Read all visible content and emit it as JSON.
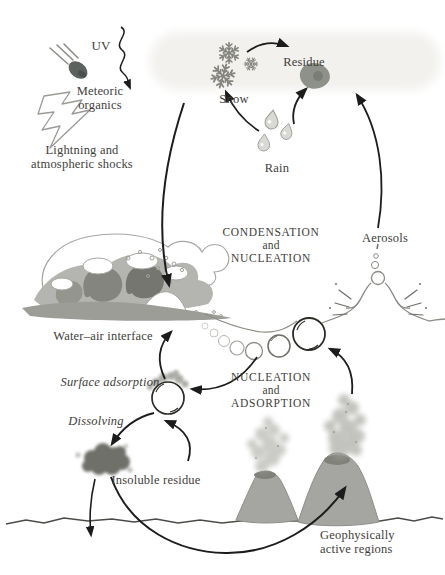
{
  "figure": {
    "type": "cycle-diagram"
  },
  "labels": {
    "uv": "UV",
    "meteoric": [
      "Meteoric",
      "organics"
    ],
    "lightning": [
      "Lightning and",
      "atmospheric shocks"
    ],
    "snow": "Snow",
    "residue": "Residue",
    "rain": "Rain",
    "condensation": [
      "CONDENSATION",
      "and",
      "NUCLEATION"
    ],
    "aerosols": "Aerosols",
    "water_air": "Water–air interface",
    "surface_adsorption": "Surface adsorption",
    "dissolving": "Dissolving",
    "insoluble_residue": "Insoluble residue",
    "nucleation": [
      "NUCLEATION",
      "and",
      "ADSORPTION"
    ],
    "geo": [
      "Geophysically",
      "active regions"
    ]
  },
  "icons": [
    "meteor-icon",
    "lightning-bolt-icon",
    "snowflake-icon",
    "raindrop-icon",
    "residue-blob",
    "aerosol-bubbles",
    "bubble-burst-icon",
    "ocean-waves",
    "bubble-chain",
    "adsorption-bubble",
    "insoluble-residue-blob",
    "volcano-icon",
    "smoke-plume",
    "ground-line",
    "arrow"
  ],
  "flows": [
    "rain to snow",
    "rain to residue",
    "snow to residue",
    "UV into atmosphere",
    "atmosphere down to water-air interface",
    "aerosols up to condensation/nucleation zone",
    "bubble chain to adsorption bubble",
    "adsorption bubble up to interface",
    "adsorption bubble dissolving to insoluble residue",
    "insoluble residue back to adsorption bubble",
    "insoluble residue down to sediment",
    "insoluble residue to geophysically active regions",
    "volcanic plume to surface bubble"
  ],
  "colors": {
    "background": "#ffffff",
    "text": "#3e3e3a",
    "arrow": "#1c1c1c",
    "wave_gray": "#b4b5b0",
    "volcano_gray": "#a5a6a1",
    "blob_dark": "#6e6f69",
    "outline_gray": "#8b8b85"
  }
}
